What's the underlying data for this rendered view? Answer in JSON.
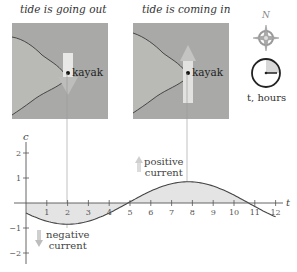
{
  "panels": {
    "left": {
      "title": "tide is going out",
      "kayak_label": "kayak",
      "current_direction": "south"
    },
    "right": {
      "title": "tide is coming in",
      "kayak_label": "kayak",
      "current_direction": "north"
    }
  },
  "legend": {
    "compass_label": "N",
    "clock_label": "t, hours"
  },
  "annotations": {
    "positive": "positive current",
    "positive_line1": "positive",
    "positive_line2": "current",
    "negative_line1": "negative",
    "negative_line2": "current"
  },
  "axes": {
    "x_label": "t",
    "y_label": "c",
    "x_ticks": [
      "1",
      "2",
      "3",
      "4",
      "5",
      "6",
      "7",
      "8",
      "9",
      "10",
      "11",
      "12"
    ],
    "y_ticks": [
      "2",
      "1",
      "−1",
      "−2"
    ]
  },
  "colors": {
    "map_water": "#a9aaa8",
    "fill": "#e4e4e4",
    "curve": "#444444",
    "arrow": "#c9c9c9"
  },
  "chart_data": {
    "type": "line",
    "title": "",
    "xlabel": "t",
    "ylabel": "c",
    "xlim": [
      0,
      12
    ],
    "ylim": [
      -2,
      2
    ],
    "x": [
      0,
      1,
      2,
      3,
      4,
      4.9,
      6,
      7,
      7.8,
      9,
      10,
      10.7,
      12
    ],
    "series": [
      {
        "name": "current c(t)",
        "values": [
          -0.4,
          -0.72,
          -0.85,
          -0.73,
          -0.4,
          0.0,
          0.45,
          0.77,
          0.85,
          0.68,
          0.3,
          0.0,
          -0.5
        ]
      }
    ],
    "fill_to_axis": true,
    "highlighted_x": [
      2,
      7.8
    ],
    "annotations": [
      "positive current",
      "negative current"
    ],
    "grid": false
  }
}
